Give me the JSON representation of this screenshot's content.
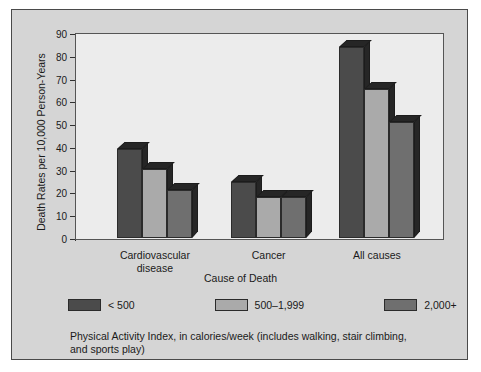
{
  "chart_data": {
    "type": "bar",
    "title": "",
    "xlabel": "Cause of Death",
    "ylabel": "Death Rates per 10,000 Person-Years",
    "categories": [
      "Cardiovascular disease",
      "Cancer",
      "All causes"
    ],
    "category_lines": [
      [
        "Cardiovascular",
        "disease"
      ],
      [
        "Cancer",
        ""
      ],
      [
        "All causes",
        ""
      ]
    ],
    "series": [
      {
        "name": "< 500",
        "color": "#4b4b4b",
        "values": [
          39,
          24.5,
          84
        ]
      },
      {
        "name": "500–1,999",
        "color": "#aaaaaa",
        "values": [
          30.5,
          18,
          65.5
        ]
      },
      {
        "name": "2,000+",
        "color": "#6f6f6f",
        "values": [
          21,
          18,
          51
        ]
      }
    ],
    "ylim": [
      0,
      90
    ],
    "yticks": [
      0,
      10,
      20,
      30,
      40,
      50,
      60,
      70,
      80,
      90
    ],
    "ytick_labels": [
      "0",
      "10",
      "20",
      "30",
      "40",
      "50",
      "60",
      "70",
      "80",
      "90"
    ],
    "grid": false,
    "legend_position": "below-axes",
    "style": "3d-bars"
  },
  "legend": {
    "items": [
      {
        "label": "< 500",
        "color": "#4b4b4b"
      },
      {
        "label": "500–1,999",
        "color": "#aaaaaa"
      },
      {
        "label": "2,000+",
        "color": "#6f6f6f"
      }
    ]
  },
  "caption": {
    "line1": "Physical Activity Index, in calories/week (includes walking, stair climbing,",
    "line2": "and sports play)"
  },
  "colors": {
    "figure_background": "#d5d5d5",
    "plot_background": "#ececec",
    "axis": "#303030",
    "text": "#1a1a1a",
    "bar_shade": "#262626"
  }
}
